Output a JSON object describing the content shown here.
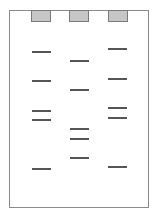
{
  "diagram": {
    "type": "gel-electrophoresis",
    "colors": {
      "border": "#8a8a8a",
      "well_fill": "#c6c6c6",
      "band": "#555555",
      "background": "#ffffff"
    },
    "lanes": [
      {
        "name": "lane-1",
        "well_x": 31,
        "band_x": 32,
        "bands_y": [
          51,
          80,
          110,
          119,
          168
        ]
      },
      {
        "name": "lane-2",
        "well_x": 69,
        "band_x": 70,
        "bands_y": [
          60,
          89,
          128,
          138,
          157
        ]
      },
      {
        "name": "lane-3",
        "well_x": 108,
        "band_x": 108,
        "bands_y": [
          48,
          78,
          107,
          117,
          166
        ]
      }
    ]
  }
}
